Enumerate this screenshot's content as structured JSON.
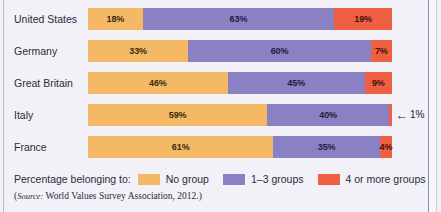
{
  "chart_data": {
    "type": "bar",
    "orientation": "horizontal",
    "stacked": true,
    "normalized_percent": true,
    "title": "",
    "xlabel": "",
    "ylabel": "",
    "xlim": [
      0,
      100
    ],
    "grid": false,
    "legend_position": "bottom",
    "categories": [
      "United States",
      "Germany",
      "Great Britain",
      "Italy",
      "France"
    ],
    "series": [
      {
        "name": "No group",
        "color": "#f5b864",
        "values": [
          18,
          33,
          46,
          59,
          61
        ]
      },
      {
        "name": "1–3 groups",
        "color": "#8a80c4",
        "values": [
          63,
          60,
          45,
          40,
          35
        ]
      },
      {
        "name": "4 or more groups",
        "color": "#ef5f43",
        "values": [
          19,
          7,
          9,
          1,
          4
        ]
      }
    ],
    "value_labels": [
      [
        "18%",
        "63%",
        "19%"
      ],
      [
        "33%",
        "60%",
        "7%"
      ],
      [
        "46%",
        "45%",
        "9%"
      ],
      [
        "59%",
        "40%",
        "1%"
      ],
      [
        "61%",
        "35%",
        "4%"
      ]
    ],
    "annotations": [
      {
        "category": "Italy",
        "series": "4 or more groups",
        "text": "1%",
        "arrow": "←",
        "placement": "outside-right"
      }
    ]
  },
  "legend": {
    "title": "Percentage belonging to:",
    "items": [
      {
        "label": "No group",
        "color": "#f5b864"
      },
      {
        "label": "1–3 groups",
        "color": "#8a80c4"
      },
      {
        "label": "4 or more groups",
        "color": "#ef5f43"
      }
    ]
  },
  "source": {
    "prefix": "(",
    "word": "Source:",
    "text": " World Values Survey Association, 2012.)"
  },
  "colors": {
    "background": "#f2f1f7",
    "no_group": "#f5b864",
    "one_to_three": "#8a80c4",
    "four_or_more": "#ef5f43",
    "text": "#2b2b38",
    "frame": "#8f8cb5"
  }
}
